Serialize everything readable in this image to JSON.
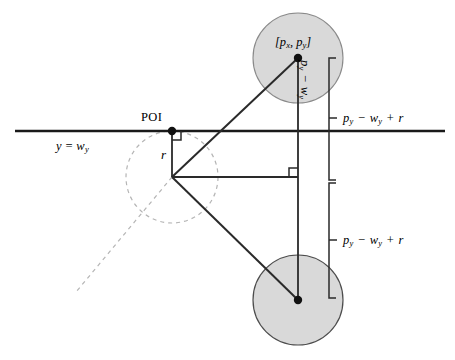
{
  "figure": {
    "type": "geometry-diagram",
    "background_color": "#ffffff",
    "stroke_color": "#1a1a1a",
    "circle_fill_color": "#d9d9d9",
    "circle_stroke_color": "#808080",
    "dashed_color": "#b0b0b0"
  },
  "labels": {
    "poi": "POI",
    "particle_coord": "[p",
    "particle_coord_sub1": "x",
    "particle_coord_mid": ", p",
    "particle_coord_sub2": "y",
    "particle_coord_end": "]",
    "wall_line": "y = w",
    "wall_line_sub": "y",
    "radius": "r",
    "vertical_distance": "p",
    "vertical_distance_sub1": "y",
    "vertical_distance_op": " − ",
    "vertical_distance_w": "w",
    "vertical_distance_sub2": "y",
    "bracket_upper": "p",
    "bracket_upper_sub1": "y",
    "bracket_upper_minus": " − ",
    "bracket_upper_w": "w",
    "bracket_upper_sub2": "y",
    "bracket_upper_plus": " + ",
    "bracket_upper_r": "r",
    "bracket_lower": "p",
    "bracket_lower_sub1": "y",
    "bracket_lower_minus": " − ",
    "bracket_lower_w": "w",
    "bracket_lower_sub2": "y",
    "bracket_lower_plus": " + ",
    "bracket_lower_r": "r"
  },
  "geometry": {
    "wall_line": {
      "x1": 15,
      "y1": 131,
      "x2": 445,
      "y2": 131
    },
    "poi_point": {
      "cx": 172,
      "cy": 131,
      "r": 4.2
    },
    "reflection_center": {
      "cx": 172,
      "cy": 177
    },
    "dashed_circle": {
      "cx": 172,
      "cy": 177,
      "r": 46
    },
    "particle_circle": {
      "cx": 298,
      "cy": 58,
      "r": 45
    },
    "particle_point": {
      "cx": 298,
      "cy": 58,
      "r": 4.2
    },
    "image_circle": {
      "cx": 298,
      "cy": 300,
      "r": 45
    },
    "image_point": {
      "cx": 298,
      "cy": 300,
      "r": 4.2
    },
    "vertical_segment": {
      "x1": 298,
      "y1": 58,
      "x2": 298,
      "y2": 300
    },
    "radius_segment": {
      "x1": 172,
      "y1": 131,
      "x2": 172,
      "y2": 177
    },
    "horizontal_segment": {
      "x1": 172,
      "y1": 177,
      "x2": 298,
      "y2": 177
    },
    "diagonal_up": {
      "x1": 172,
      "y1": 177,
      "x2": 298,
      "y2": 58
    },
    "diagonal_down": {
      "x1": 172,
      "y1": 177,
      "x2": 298,
      "y2": 300
    },
    "dashed_ray": {
      "x1": 172,
      "y1": 177,
      "x2": 76,
      "y2": 292
    },
    "bracket_upper": {
      "x": 329,
      "y_top": 58,
      "y_bottom": 180,
      "tick_y": 118
    },
    "bracket_lower": {
      "x": 329,
      "y_top": 183,
      "y_bottom": 298,
      "tick_y": 240
    }
  }
}
